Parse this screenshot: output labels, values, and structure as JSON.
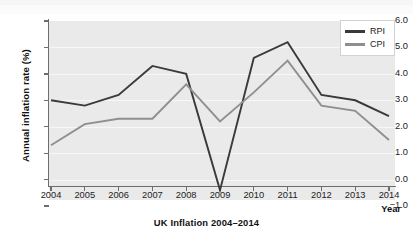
{
  "chart_data": {
    "type": "line",
    "title": "UK Inflation 2004–2014",
    "xlabel": "Year",
    "ylabel": "Annual inflation rate (%)",
    "grid": true,
    "legend_position": "top-right",
    "x": [
      2004,
      2005,
      2006,
      2007,
      2008,
      2009,
      2010,
      2011,
      2012,
      2013,
      2014
    ],
    "categories": [
      "2004",
      "2005",
      "2006",
      "2007",
      "2008",
      "2009",
      "2010",
      "2011",
      "2012",
      "2013",
      "2014"
    ],
    "xlim": [
      2004,
      2014
    ],
    "ylim": [
      -1.0,
      6.0
    ],
    "yticks": [
      -1.0,
      0.0,
      1.0,
      2.0,
      3.0,
      4.0,
      5.0,
      6.0
    ],
    "ytick_labels": [
      "-1.0",
      "0.0",
      "1.0",
      "2.0",
      "3.0",
      "4.0",
      "5.0",
      "6.0"
    ],
    "series": [
      {
        "name": "RPI",
        "color": "#3a3a3a",
        "values": [
          3.0,
          2.8,
          3.2,
          4.3,
          4.0,
          -0.4,
          4.6,
          5.2,
          3.2,
          3.0,
          2.4
        ]
      },
      {
        "name": "CPI",
        "color": "#8f8f8f",
        "values": [
          1.3,
          2.1,
          2.3,
          2.3,
          3.6,
          2.2,
          3.3,
          4.5,
          2.8,
          2.6,
          1.5
        ]
      }
    ]
  },
  "legend": {
    "entries": [
      {
        "label": "RPI"
      },
      {
        "label": "CPI"
      }
    ]
  },
  "axes": {
    "y_axis_title": "Annual inflation rate (%)",
    "x_axis_title": "Year"
  },
  "colors": {
    "rpi": "#3a3a3a",
    "cpi": "#8f8f8f",
    "plot_background": "#eaeaea",
    "gridline": "#f7f7f7",
    "axis": "#6d6d6d"
  }
}
